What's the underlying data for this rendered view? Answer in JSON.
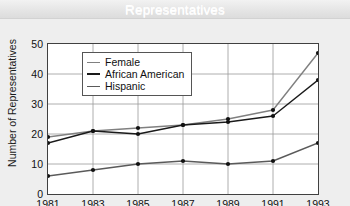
{
  "title": "Representatives",
  "chart_data": {
    "type": "line",
    "title": "Representatives",
    "xlabel": "",
    "ylabel": "Number of Representatives",
    "categories": [
      "1981",
      "1983",
      "1985",
      "1987",
      "1989",
      "1991",
      "1993"
    ],
    "x": [
      1981,
      1983,
      1985,
      1987,
      1989,
      1991,
      1993
    ],
    "xlim": [
      1981,
      1993
    ],
    "ylim": [
      0,
      50
    ],
    "yticks": [
      "0",
      "10",
      "20",
      "30",
      "40",
      "50"
    ],
    "ytick_values": [
      0,
      10,
      20,
      30,
      40,
      50
    ],
    "grid": true,
    "legend_position": "upper-left",
    "series": [
      {
        "name": "Female",
        "color": "#808080",
        "values": [
          19,
          21,
          22,
          23,
          25,
          28,
          47
        ]
      },
      {
        "name": "African American",
        "color": "#1a1a1a",
        "values": [
          17,
          21,
          20,
          23,
          24,
          26,
          38
        ]
      },
      {
        "name": "Hispanic",
        "color": "#5a5a5a",
        "values": [
          6,
          8,
          10,
          11,
          10,
          11,
          17
        ]
      }
    ]
  },
  "legend": {
    "items": [
      {
        "label": "Female"
      },
      {
        "label": "African American"
      },
      {
        "label": "Hispanic"
      }
    ]
  },
  "axes": {
    "y_title": "Number of Representatives"
  }
}
